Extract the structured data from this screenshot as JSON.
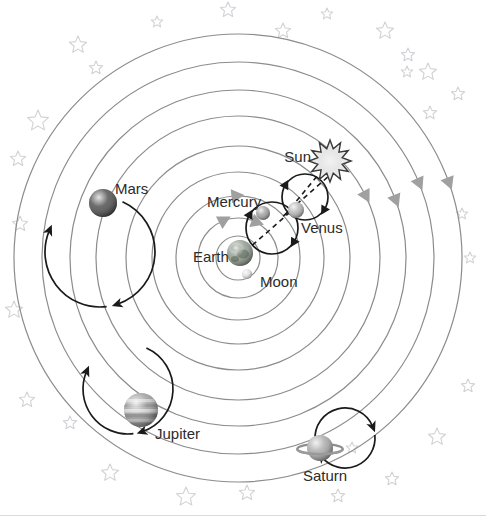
{
  "figure": {
    "background_color": "#ffffff",
    "width": 486,
    "height": 516
  },
  "colors": {
    "orbit_ring": "#8c8c8c",
    "epicycle": "#1a1a1a",
    "ring_arrow": "#a0a0a0",
    "star_outline": "#d2d2d6",
    "label_text": "#2b2b2b",
    "sun_fill": "#e8e8e8",
    "sun_outline": "#3a3a3a",
    "mars_body": "#4a4a4a",
    "jupiter_body": "#9a9a9a",
    "saturn_body": "#a8a8a8",
    "earth_body": "#7e7e7e",
    "mercury_body": "#9e9e9e",
    "venus_body": "#b5b5b5",
    "moon_body": "#e0e0e0"
  },
  "center": {
    "x": 238,
    "y": 258
  },
  "labels": [
    {
      "id": "sun",
      "text": "Sun",
      "x": 311,
      "y": 162,
      "anchor": "end",
      "size": 15
    },
    {
      "id": "mercury",
      "text": "Mercury",
      "x": 207,
      "y": 207,
      "anchor": "start",
      "size": 15
    },
    {
      "id": "venus",
      "text": "Venus",
      "x": 301,
      "y": 233,
      "anchor": "start",
      "size": 15
    },
    {
      "id": "earth",
      "text": "Earth",
      "x": 193,
      "y": 262,
      "anchor": "start",
      "size": 15
    },
    {
      "id": "moon",
      "text": "Moon",
      "x": 260,
      "y": 287,
      "anchor": "start",
      "size": 15
    },
    {
      "id": "mars",
      "text": "Mars",
      "x": 115,
      "y": 194,
      "anchor": "start",
      "size": 15
    },
    {
      "id": "jupiter",
      "text": "Jupiter",
      "x": 155,
      "y": 439,
      "anchor": "start",
      "size": 15
    },
    {
      "id": "saturn",
      "text": "Saturn",
      "x": 303,
      "y": 481,
      "anchor": "start",
      "size": 15
    }
  ],
  "orbit_rings": [
    {
      "id": "ring-1-moon",
      "r": 22
    },
    {
      "id": "ring-2-inner",
      "r": 40
    },
    {
      "id": "ring-3",
      "r": 62
    },
    {
      "id": "ring-4-mercury",
      "r": 86
    },
    {
      "id": "ring-5-venus",
      "r": 112
    },
    {
      "id": "ring-6-sun",
      "r": 142
    },
    {
      "id": "ring-7-mars",
      "r": 168
    },
    {
      "id": "ring-8-jupiter",
      "r": 196
    },
    {
      "id": "ring-9-saturn",
      "r": 224
    }
  ],
  "ring_direction_arrows": [
    {
      "ring_r": 40,
      "angle_deg": 118
    },
    {
      "ring_r": 40,
      "angle_deg": 70
    },
    {
      "ring_r": 62,
      "angle_deg": 96
    },
    {
      "ring_r": 142,
      "angle_deg": 28
    },
    {
      "ring_r": 168,
      "angle_deg": 22
    },
    {
      "ring_r": 196,
      "angle_deg": 24
    },
    {
      "ring_r": 224,
      "angle_deg": 21
    }
  ],
  "planets": [
    {
      "id": "sun",
      "x": 330,
      "y": 161,
      "r": 13,
      "kind": "sunburst"
    },
    {
      "id": "mercury",
      "x": 263,
      "y": 213,
      "r": 7,
      "kind": "sphere",
      "shade": "#9e9e9e"
    },
    {
      "id": "venus",
      "x": 296,
      "y": 210,
      "r": 8,
      "kind": "sphere",
      "shade": "#b5b5b5"
    },
    {
      "id": "earth",
      "x": 240,
      "y": 253,
      "r": 13,
      "kind": "earth",
      "shade": "#7e7e7e"
    },
    {
      "id": "moon",
      "x": 247,
      "y": 274,
      "r": 5,
      "kind": "sphere",
      "shade": "#e0e0e0"
    },
    {
      "id": "mars",
      "x": 103,
      "y": 203,
      "r": 14,
      "kind": "sphere",
      "shade": "#4a4a4a"
    },
    {
      "id": "jupiter",
      "x": 141,
      "y": 410,
      "r": 17,
      "kind": "banded",
      "shade": "#9a9a9a"
    },
    {
      "id": "saturn",
      "x": 320,
      "y": 448,
      "r": 13,
      "kind": "ringed",
      "shade": "#a8a8a8"
    }
  ],
  "epicycles": [
    {
      "id": "epicycle-mercury",
      "cx": 272,
      "cy": 228,
      "r": 26
    },
    {
      "id": "epicycle-venus",
      "cx": 305,
      "cy": 197,
      "r": 23
    },
    {
      "id": "epicycle-mars",
      "cx": 100,
      "cy": 252,
      "r": 55
    },
    {
      "id": "epicycle-jupiter",
      "cx": 128,
      "cy": 389,
      "r": 45
    },
    {
      "id": "epicycle-saturn",
      "cx": 345,
      "cy": 438,
      "r": 30
    }
  ],
  "sun_connector": {
    "from_x": 285,
    "from_y": 215,
    "to_x": 318,
    "to_y": 175,
    "style": "dashed"
  },
  "stars": [
    {
      "x": 78,
      "y": 45,
      "s": 9
    },
    {
      "x": 96,
      "y": 68,
      "s": 7
    },
    {
      "x": 38,
      "y": 121,
      "s": 11
    },
    {
      "x": 18,
      "y": 159,
      "s": 8
    },
    {
      "x": 228,
      "y": 10,
      "s": 8
    },
    {
      "x": 157,
      "y": 22,
      "s": 6
    },
    {
      "x": 283,
      "y": 31,
      "s": 8
    },
    {
      "x": 327,
      "y": 14,
      "s": 6
    },
    {
      "x": 385,
      "y": 31,
      "s": 9
    },
    {
      "x": 408,
      "y": 55,
      "s": 7
    },
    {
      "x": 407,
      "y": 72,
      "s": 6
    },
    {
      "x": 428,
      "y": 72,
      "s": 9
    },
    {
      "x": 430,
      "y": 113,
      "s": 7
    },
    {
      "x": 458,
      "y": 94,
      "s": 7
    },
    {
      "x": 20,
      "y": 224,
      "s": 8
    },
    {
      "x": 14,
      "y": 310,
      "s": 9
    },
    {
      "x": 27,
      "y": 400,
      "s": 8
    },
    {
      "x": 70,
      "y": 423,
      "s": 7
    },
    {
      "x": 110,
      "y": 473,
      "s": 9
    },
    {
      "x": 186,
      "y": 497,
      "s": 10
    },
    {
      "x": 247,
      "y": 493,
      "s": 8
    },
    {
      "x": 338,
      "y": 496,
      "s": 7
    },
    {
      "x": 392,
      "y": 479,
      "s": 7
    },
    {
      "x": 437,
      "y": 437,
      "s": 9
    },
    {
      "x": 468,
      "y": 386,
      "s": 7
    },
    {
      "x": 470,
      "y": 258,
      "s": 6
    },
    {
      "x": 462,
      "y": 214,
      "s": 6
    },
    {
      "x": 352,
      "y": 448,
      "s": 6
    }
  ]
}
